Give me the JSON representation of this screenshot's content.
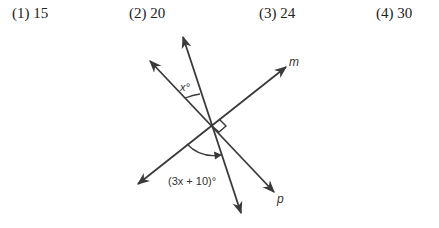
{
  "choices": [
    {
      "label": "(1) 15"
    },
    {
      "label": "(2) 20"
    },
    {
      "label": "(3) 24"
    },
    {
      "label": "(4) 30"
    }
  ],
  "figure": {
    "line_m_label": "m",
    "line_p_label": "p",
    "angle_top_label": "x°",
    "angle_bottom_label": "(3x + 10)°",
    "right_angle_between": [
      "m",
      "p"
    ],
    "line_color": "#3a3a3a"
  }
}
